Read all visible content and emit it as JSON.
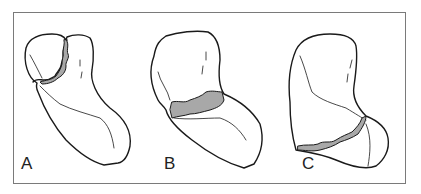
{
  "figure": {
    "panels": [
      {
        "label": "A",
        "description": "bone with fracture line near head (upper left)"
      },
      {
        "label": "B",
        "description": "bone with comminuted fracture across mid-neck"
      },
      {
        "label": "C",
        "description": "bone with fracture line near distal end"
      }
    ],
    "colors": {
      "outline": "#1a1a1a",
      "fracture_fill": "#a8a8a8",
      "border": "#7a7a7a"
    }
  }
}
